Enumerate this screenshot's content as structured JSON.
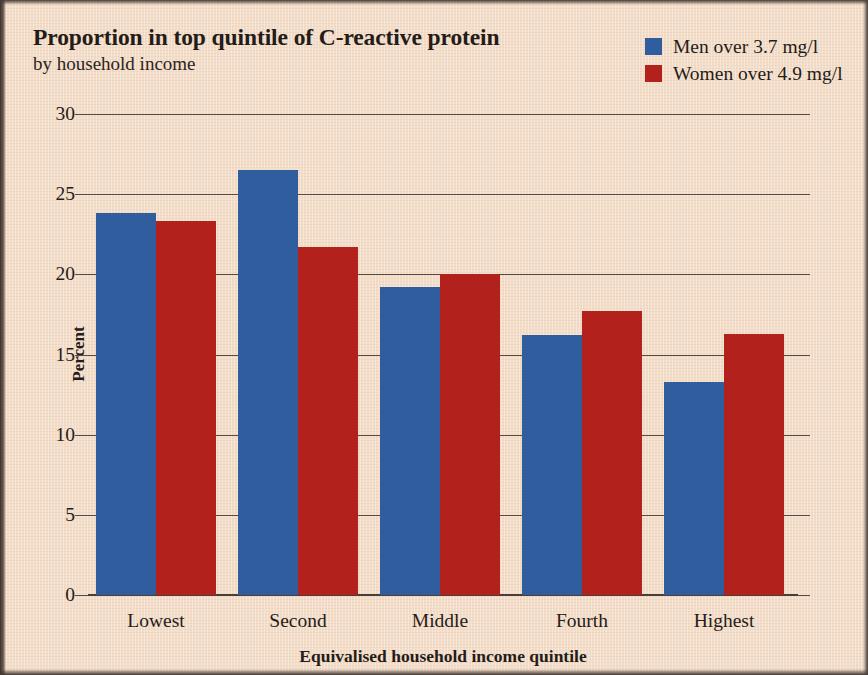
{
  "chart_data": {
    "type": "bar",
    "title": "Proportion in top quintile of C-reactive protein",
    "subtitle": "by household income",
    "xlabel": "Equivalised household income quintile",
    "ylabel": "Percent",
    "categories": [
      "Lowest",
      "Second",
      "Middle",
      "Fourth",
      "Highest"
    ],
    "series": [
      {
        "name": "Men over 3.7 mg/l",
        "color": "#2f5d9e",
        "values": [
          23.8,
          26.5,
          19.2,
          16.2,
          13.3
        ]
      },
      {
        "name": "Women over 4.9 mg/l",
        "color": "#b2211b",
        "values": [
          23.3,
          21.7,
          20.0,
          17.7,
          16.3
        ]
      }
    ],
    "ylim": [
      0,
      30
    ],
    "yticks": [
      0,
      5,
      10,
      15,
      20,
      25,
      30
    ],
    "ytick_labels": [
      "0",
      "5",
      "10",
      "15",
      "20",
      "25",
      "30"
    ],
    "grid": "horizontal",
    "legend_position": "top-right",
    "background_color": "#f4ddc8"
  }
}
